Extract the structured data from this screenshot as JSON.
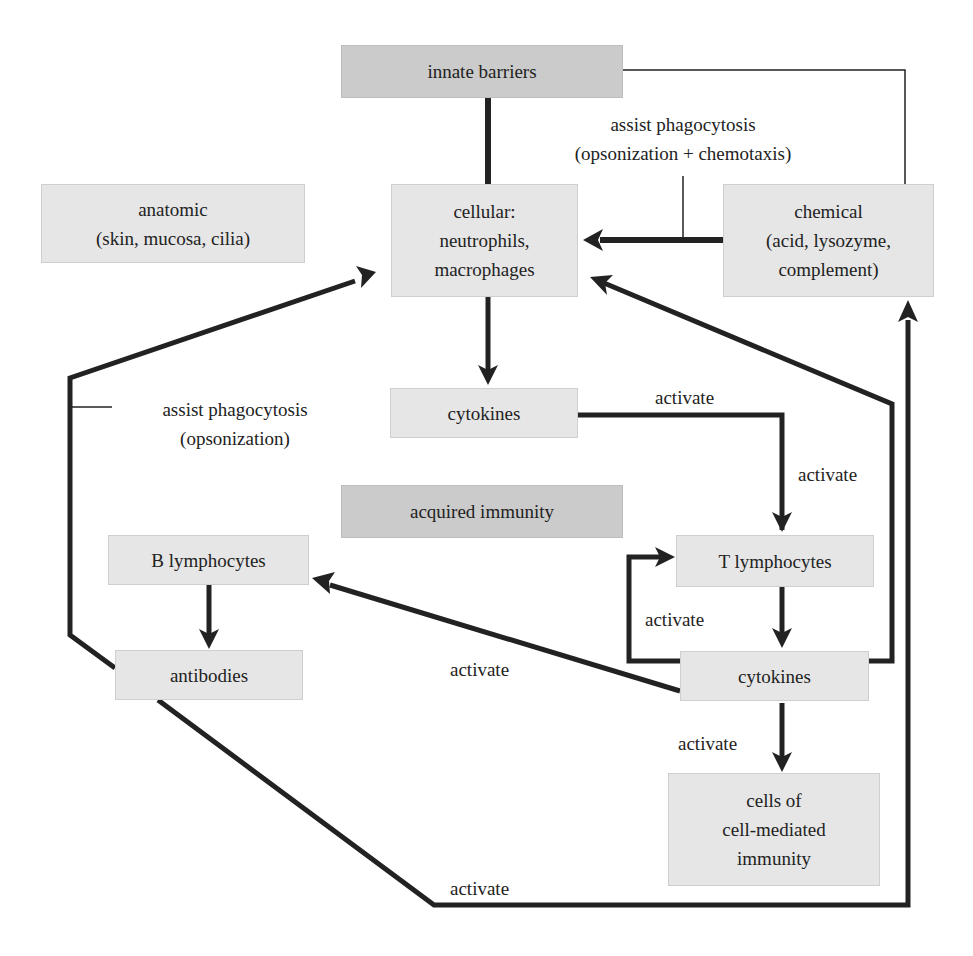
{
  "diagram": {
    "colors": {
      "box_fill": "#e6e6e6",
      "header_box_fill": "#cbcbcb",
      "line": "#222222",
      "text": "#222222",
      "background": "#ffffff"
    },
    "nodes": {
      "innate_barriers": {
        "lines": [
          "innate barriers"
        ]
      },
      "anatomic": {
        "lines": [
          "anatomic",
          "(skin, mucosa, cilia)"
        ]
      },
      "cellular": {
        "lines": [
          "cellular:",
          "neutrophils,",
          "macrophages"
        ]
      },
      "chemical": {
        "lines": [
          "chemical",
          "(acid, lysozyme,",
          "complement)"
        ]
      },
      "cytokines_innate": {
        "lines": [
          "cytokines"
        ]
      },
      "acquired_immunity": {
        "lines": [
          "acquired immunity"
        ]
      },
      "b_lymphocytes": {
        "lines": [
          "B lymphocytes"
        ]
      },
      "t_lymphocytes": {
        "lines": [
          "T lymphocytes"
        ]
      },
      "antibodies": {
        "lines": [
          "antibodies"
        ]
      },
      "cytokines_acquired": {
        "lines": [
          "cytokines"
        ]
      },
      "cell_mediated": {
        "lines": [
          "cells of",
          "cell-mediated",
          "immunity"
        ]
      }
    },
    "edge_labels": {
      "assist_chemotaxis": [
        "assist phagocytosis",
        "(opsonization + chemotaxis)"
      ],
      "assist_opsonization": [
        "assist phagocytosis",
        "(opsonization)"
      ],
      "activate_cyto_to_t_top": "activate",
      "activate_cyto_to_t_side": "activate",
      "activate_loop": "activate",
      "activate_to_b": "activate",
      "activate_to_cell_mediated": "activate",
      "activate_bottom": "activate"
    },
    "edges": [
      {
        "from": "innate barriers",
        "to": "cellular: neutrophils, macrophages",
        "type": "line"
      },
      {
        "from": "innate barriers",
        "to": "chemical",
        "type": "thin-line"
      },
      {
        "from": "chemical",
        "to": "cellular: neutrophils, macrophages",
        "type": "arrow",
        "label": "assist phagocytosis (opsonization + chemotaxis)"
      },
      {
        "from": "cellular: neutrophils, macrophages",
        "to": "cytokines",
        "type": "arrow"
      },
      {
        "from": "cytokines",
        "to": "T lymphocytes",
        "type": "arrow",
        "label": "activate"
      },
      {
        "from": "T lymphocytes",
        "to": "cytokines (acquired)",
        "type": "arrow"
      },
      {
        "from": "cytokines (acquired)",
        "to": "T lymphocytes",
        "type": "arrow",
        "label": "activate"
      },
      {
        "from": "cytokines (acquired)",
        "to": "B lymphocytes",
        "type": "arrow",
        "label": "activate"
      },
      {
        "from": "cytokines (acquired)",
        "to": "cellular: neutrophils, macrophages",
        "type": "arrow"
      },
      {
        "from": "cytokines (acquired)",
        "to": "cells of cell-mediated immunity",
        "type": "arrow",
        "label": "activate"
      },
      {
        "from": "B lymphocytes",
        "to": "antibodies",
        "type": "arrow"
      },
      {
        "from": "antibodies",
        "to": "cellular: neutrophils, macrophages",
        "type": "arrow",
        "label": "assist phagocytosis (opsonization)"
      },
      {
        "from": "antibodies",
        "to": "chemical",
        "type": "arrow",
        "label": "activate"
      }
    ]
  }
}
